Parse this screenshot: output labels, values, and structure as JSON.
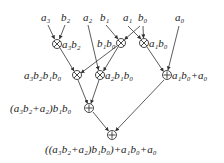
{
  "diagram": {
    "type": "expression-tree",
    "inputs": [
      {
        "id": "a3",
        "base": "a",
        "sub": "3",
        "x": 46,
        "y": 20
      },
      {
        "id": "b2",
        "base": "b",
        "sub": "2",
        "x": 65,
        "y": 20
      },
      {
        "id": "a2",
        "base": "a",
        "sub": "2",
        "x": 87,
        "y": 20
      },
      {
        "id": "b1",
        "base": "b",
        "sub": "1",
        "x": 103,
        "y": 20
      },
      {
        "id": "a1",
        "base": "a",
        "sub": "1",
        "x": 126,
        "y": 20
      },
      {
        "id": "b0",
        "base": "b",
        "sub": "0",
        "x": 142,
        "y": 20
      },
      {
        "id": "a0",
        "base": "a",
        "sub": "0",
        "x": 179,
        "y": 20
      }
    ],
    "nodes": [
      {
        "id": "m1",
        "op": "multiply",
        "x": 57,
        "y": 44,
        "label": "a3b2"
      },
      {
        "id": "m2",
        "op": "multiply",
        "x": 121,
        "y": 43,
        "label": "b1b0"
      },
      {
        "id": "m3",
        "op": "multiply",
        "x": 144,
        "y": 43,
        "label": "a1b0"
      },
      {
        "id": "m4",
        "op": "multiply",
        "x": 77,
        "y": 75,
        "label": "a3b2b1b0"
      },
      {
        "id": "m5",
        "op": "multiply",
        "x": 100,
        "y": 75,
        "label": "a2b1b0"
      },
      {
        "id": "s1",
        "op": "add",
        "x": 167,
        "y": 75,
        "label": "a1b0+a0"
      },
      {
        "id": "s2",
        "op": "add",
        "x": 89,
        "y": 108,
        "label": "(a3b2+a2)b1b0"
      },
      {
        "id": "s3",
        "op": "add",
        "x": 112,
        "y": 135,
        "label": "((a3b2+a2)b1b0)+a1b0+a0"
      }
    ],
    "edges": [
      [
        "a3",
        "m1"
      ],
      [
        "b2",
        "m1"
      ],
      [
        "b1",
        "m2"
      ],
      [
        "b0",
        "m2"
      ],
      [
        "a1",
        "m3"
      ],
      [
        "b0",
        "m3"
      ],
      [
        "m1",
        "m4"
      ],
      [
        "m2",
        "m4"
      ],
      [
        "a2",
        "m5"
      ],
      [
        "m2",
        "m5"
      ],
      [
        "m3",
        "s1"
      ],
      [
        "a0",
        "s1"
      ],
      [
        "m4",
        "s2"
      ],
      [
        "m5",
        "s2"
      ],
      [
        "s2",
        "s3"
      ],
      [
        "s1",
        "s3"
      ]
    ],
    "node_labels": {
      "m1": "a₃b₂",
      "m2": "b₁b₀",
      "m3": "a₁b₀",
      "m4": "a₃b₂b₁b₀",
      "m5": "a₂b₁b₀",
      "s1": "a₁b₀+a₀",
      "s2": "(a₃b₂+a₂)b₁b₀",
      "s3": "((a₃b₂+a₂)b₁b₀)+a₁b₀+a₀"
    },
    "input_labels": {
      "a3": "a₃",
      "b2": "b₂",
      "a2": "a₂",
      "b1": "b₁",
      "a1": "a₁",
      "b0": "b₀",
      "a0": "a₀"
    }
  }
}
